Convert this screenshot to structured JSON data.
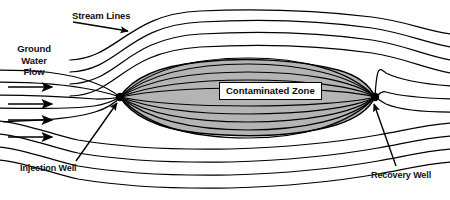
{
  "figure": {
    "domain": "Diagram",
    "width": 450,
    "height": 200,
    "background_color": "#ffffff",
    "line_color": "#000000",
    "zone_fill_color": "#b4b4b4",
    "zone_stroke_color": "#000000",
    "well_marker_color": "#000000"
  },
  "labels": {
    "stream_lines": "Stream Lines",
    "ground_water_flow_line1": "Ground",
    "ground_water_flow_line2": "Water",
    "ground_water_flow_line3": "Flow",
    "contaminated_zone": "Contaminated Zone",
    "injection_well": "Injection Well",
    "recovery_well": "Recovery Well",
    "caption_strip": ""
  },
  "diagram_data": {
    "type": "flow-net",
    "wells": [
      {
        "name": "injection-well",
        "x": 120,
        "y": 97,
        "marker": "filled-dot",
        "radius": 4.2
      },
      {
        "name": "recovery-well",
        "x": 375,
        "y": 97,
        "marker": "filled-dot",
        "radius": 4.2
      }
    ],
    "flow_arrows": {
      "name": "ground-water-flow-arrows",
      "count": 4,
      "direction": "left-to-right",
      "x_start": 8,
      "x_end": 56,
      "y_values": [
        87,
        104,
        120,
        137
      ]
    },
    "contaminated_zone": {
      "shape": "lens",
      "left_x": 120,
      "right_x": 375,
      "top_y": 62,
      "bottom_y": 133,
      "fill": "#b4b4b4"
    },
    "internal_stream_lines": {
      "description": "lens-shaped arcs connecting injection well to recovery well through the contaminated zone",
      "count": 10,
      "bulge_values": [
        -35,
        -27,
        -19,
        -11,
        -4,
        4,
        11,
        19,
        27,
        36
      ]
    },
    "external_stream_lines": {
      "description": "arcs diverting around the well pair, above and below",
      "count_above": 4,
      "count_below": 4
    },
    "leader_lines": [
      {
        "name": "stream-lines-leader",
        "from_x": 72,
        "from_y": 22,
        "to_x": 131,
        "to_y": 32
      },
      {
        "name": "injection-well-leader",
        "from_x": 76,
        "from_y": 162,
        "to_x": 117,
        "to_y": 104
      },
      {
        "name": "recovery-well-leader",
        "from_x": 395,
        "from_y": 167,
        "to_x": 373,
        "to_y": 104
      }
    ]
  }
}
